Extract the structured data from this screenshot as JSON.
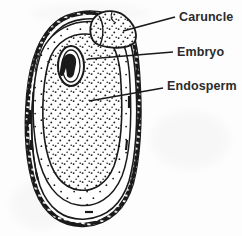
{
  "figure": {
    "kind": "botanical-line-drawing",
    "background_color": "#fdfdfd",
    "ink_color": "#1a1a1a",
    "width": 242,
    "height": 236
  },
  "labels": [
    {
      "id": "caruncle",
      "text": "Caruncle",
      "leader": {
        "x1": 123,
        "y1": 31,
        "x2": 175,
        "y2": 17
      }
    },
    {
      "id": "embryo",
      "text": "Embryo",
      "leader": {
        "x1": 88,
        "y1": 59,
        "x2": 173,
        "y2": 52
      }
    },
    {
      "id": "endosperm",
      "text": "Endosperm",
      "leader": {
        "x1": 89,
        "y1": 101,
        "x2": 163,
        "y2": 88
      }
    }
  ],
  "parts": {
    "seed_coat_label": "seed coat",
    "caruncle_label": "caruncle",
    "embryo_label": "embryo",
    "endosperm_label": "endosperm"
  }
}
